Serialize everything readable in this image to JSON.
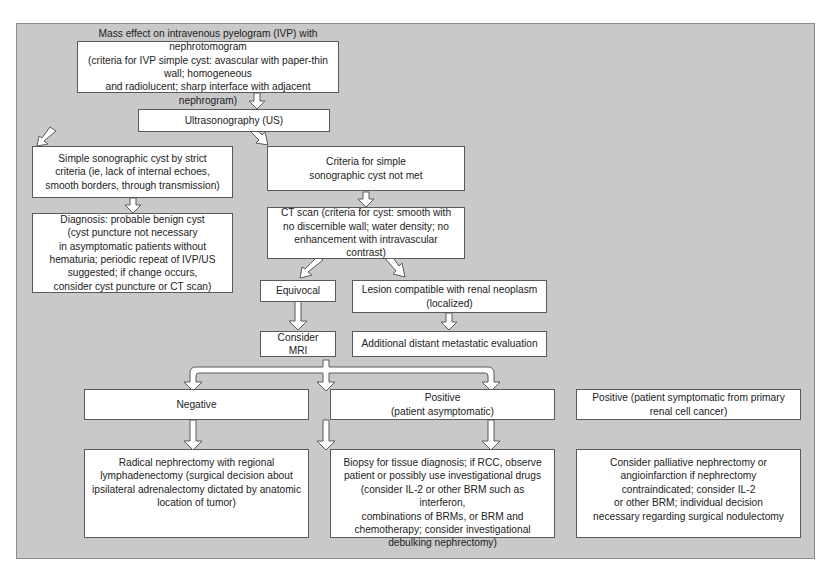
{
  "diagram": {
    "nodes": {
      "ivp": {
        "text": "Mass effect on intravenous pyelogram (IVP) with nephrotomogram\n(criteria for IVP simple cyst: avascular with paper-thin wall; homogeneous\nand radiolucent; sharp interface with adjacent nephrogram)"
      },
      "us": {
        "text": "Ultrasonography (US)"
      },
      "simple_cyst": {
        "text": "Simple sonographic cyst by strict\ncriteria (ie, lack of internal echoes,\nsmooth borders, through transmission)"
      },
      "not_met": {
        "text": "Criteria for simple\nsonographic cyst not met"
      },
      "diagnosis": {
        "text": "Diagnosis: probable benign cyst\n(cyst puncture not necessary\nin asymptomatic patients without\nhematuria; periodic repeat of IVP/US\nsuggested; if change occurs,\nconsider cyst puncture or CT scan)"
      },
      "ct": {
        "text": "CT scan (criteria for cyst: smooth with\nno discernible wall; water density; no\nenhancement with intravascular contrast)"
      },
      "equivocal": {
        "text": "Equivocal"
      },
      "lesion": {
        "text": "Lesion compatible with renal neoplasm\n(localized)"
      },
      "mri": {
        "text": "Consider MRI"
      },
      "metastatic": {
        "text": "Additional distant metastatic evaluation"
      },
      "negative": {
        "text": "Negative"
      },
      "positive_asym": {
        "text": "Positive\n(patient asymptomatic)"
      },
      "positive_sym": {
        "text": "Positive (patient symptomatic from primary\nrenal cell cancer)"
      },
      "radical": {
        "text": "Radical nephrectomy with regional\nlymphadenectomy (surgical decision about\nipsilateral adrenalectomy dictated by anatomic\nlocation of tumor)"
      },
      "biopsy": {
        "text": "Biopsy for tissue diagnosis; if RCC,  observe\npatient or possibly use  investigational drugs\n(consider IL-2 or other BRM such as interferon,\ncombinations of BRMs, or BRM and\nchemotherapy; consider investigational\ndebulking nephrectomy)"
      },
      "palliative": {
        "text": "Consider palliative nephrectomy or\nangioinfarction if nephrectomy\ncontraindicated; consider IL-2\nor other BRM; individual decision\nnecessary regarding surgical nodulectomy"
      }
    },
    "edges": [
      [
        "ivp",
        "us"
      ],
      [
        "us",
        "simple_cyst"
      ],
      [
        "us",
        "not_met"
      ],
      [
        "simple_cyst",
        "diagnosis"
      ],
      [
        "not_met",
        "ct"
      ],
      [
        "ct",
        "equivocal"
      ],
      [
        "ct",
        "lesion"
      ],
      [
        "equivocal",
        "mri"
      ],
      [
        "lesion",
        "metastatic"
      ],
      [
        "metastatic",
        "negative"
      ],
      [
        "metastatic",
        "positive_asym"
      ],
      [
        "metastatic",
        "positive_sym"
      ],
      [
        "negative",
        "radical"
      ],
      [
        "positive_asym",
        "biopsy"
      ],
      [
        "positive_sym",
        "palliative"
      ]
    ],
    "colors": {
      "background": "#c9c9c9",
      "box": "#ffffff",
      "border": "#5a5a5a"
    }
  }
}
